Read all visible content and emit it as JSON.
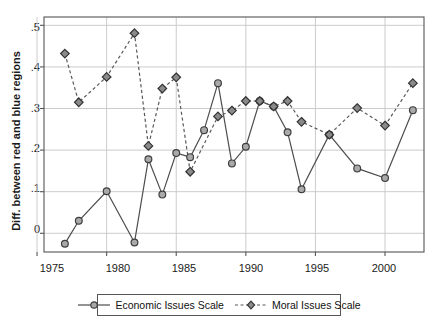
{
  "chart_data": {
    "type": "line",
    "title": "",
    "xlabel": "",
    "ylabel": "Diff. between red and blue regions",
    "xlim": [
      1975.5,
      2002.8
    ],
    "ylim": [
      -0.045,
      0.52
    ],
    "xticks": [
      1975,
      1980,
      1985,
      1990,
      1995,
      2000
    ],
    "xtick_labels": [
      "1975",
      "1980",
      "1985",
      "1990",
      "1995",
      "2000"
    ],
    "yticks": [
      0,
      0.1,
      0.2,
      0.3,
      0.4,
      0.5
    ],
    "ytick_labels": [
      "0",
      ".1",
      ".2",
      ".3",
      ".4",
      ".5"
    ],
    "grid": "horizontal-and-vertical",
    "legend_position": "bottom-center",
    "series": [
      {
        "name": "Economic Issues Scale",
        "marker": "circle",
        "linestyle": "solid",
        "color": "#4d4d4d",
        "x": [
          1977,
          1978,
          1980,
          1982,
          1983,
          1984,
          1985,
          1986,
          1987,
          1988,
          1989,
          1990,
          1991,
          1992,
          1993,
          1994,
          1996,
          1998,
          2000,
          2002
        ],
        "values": [
          -0.025,
          0.03,
          0.101,
          -0.022,
          0.178,
          0.093,
          0.193,
          0.183,
          0.248,
          0.361,
          0.168,
          0.208,
          0.318,
          0.305,
          0.243,
          0.106,
          0.237,
          0.156,
          0.133,
          0.296
        ]
      },
      {
        "name": "Moral Issues Scale",
        "marker": "diamond",
        "linestyle": "dashed",
        "color": "#595959",
        "x": [
          1977,
          1978,
          1980,
          1982,
          1983,
          1984,
          1985,
          1986,
          1988,
          1989,
          1990,
          1991,
          1992,
          1993,
          1994,
          1996,
          1998,
          2000,
          2002
        ],
        "values": [
          0.432,
          0.315,
          0.376,
          0.481,
          0.21,
          0.348,
          0.375,
          0.148,
          0.281,
          0.295,
          0.318,
          0.318,
          0.305,
          0.318,
          0.268,
          0.237,
          0.301,
          0.259,
          0.361
        ]
      }
    ]
  },
  "legend": {
    "items": [
      {
        "label": "Economic Issues Scale",
        "key": "solid-line-circle-marker"
      },
      {
        "label": "Moral Issues Scale",
        "key": "dashed-line-diamond-marker"
      }
    ]
  },
  "axis": {
    "y_title": "Diff. between red and blue regions"
  },
  "colors": {
    "plot_line": "#4d4d4d",
    "grid": "#cccccc",
    "frame": "#555555",
    "marker_fill": "#9a9a9a",
    "background": "#ffffff"
  }
}
